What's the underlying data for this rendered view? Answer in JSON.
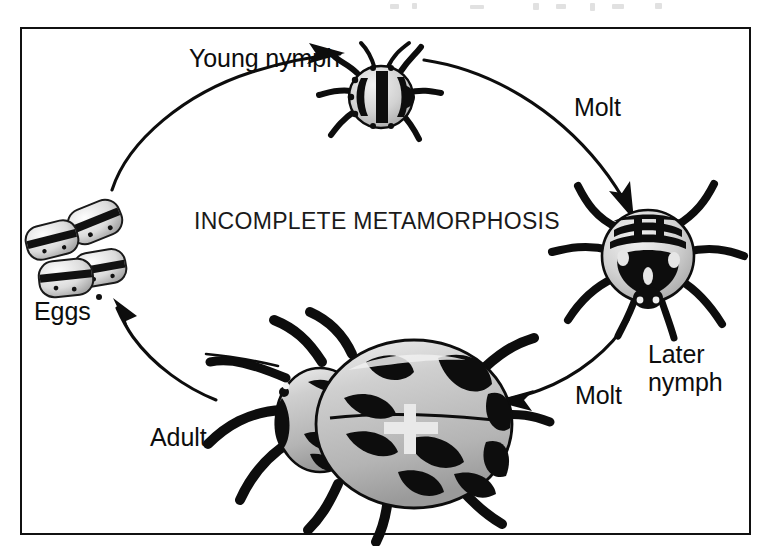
{
  "figure": {
    "title": "INCOMPLETE METAMORPHOSIS",
    "background_color": "#ffffff",
    "ink_color": "#0d0d0d",
    "frame_color": "#111111",
    "body_fill_color": "#bdbdbd",
    "body_highlight_color": "#e8e8e8"
  },
  "labels": {
    "young_nymph": "Young nymph",
    "molt_upper": "Molt",
    "later_nymph_line1": "Later",
    "later_nymph_line2": "nymph",
    "molt_lower": "Molt",
    "adult": "Adult",
    "eggs": "Eggs"
  },
  "cycle": {
    "name": "incomplete-metamorphosis-life-cycle",
    "direction": "clockwise",
    "stages": [
      {
        "id": "eggs",
        "label": "Eggs",
        "position": "left",
        "illustration": "cluster of four barrel-shaped eggs with black bands and dark spots"
      },
      {
        "id": "young-nymph",
        "label": "Young nymph",
        "position": "top",
        "illustration": "small rounded nymph with bold black striped markings and six legs"
      },
      {
        "id": "later-nymph",
        "label": "Later nymph",
        "position": "right",
        "illustration": "larger nymph with banded abdomen, dark thorax and six long legs"
      },
      {
        "id": "adult",
        "label": "Adult",
        "position": "bottom-center",
        "illustration": "large oval beetle with gray wing covers, black blotches, legs and antennae"
      }
    ],
    "transitions": [
      {
        "from": "eggs",
        "to": "young-nymph",
        "label": "",
        "arrow": "curved-arc-up-right"
      },
      {
        "from": "young-nymph",
        "to": "later-nymph",
        "label": "Molt",
        "arrow": "curved-arc-down-right"
      },
      {
        "from": "later-nymph",
        "to": "adult",
        "label": "Molt",
        "arrow": "curved-arc-down-left"
      },
      {
        "from": "adult",
        "to": "eggs",
        "label": "",
        "arrow": "curved-arc-up-left"
      }
    ]
  }
}
